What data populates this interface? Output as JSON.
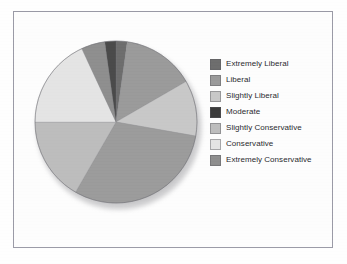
{
  "chart_data": {
    "type": "pie",
    "title": "",
    "legend_position": "right",
    "categories": [
      "Extremely Liberal",
      "Liberal",
      "Slightly Liberal",
      "Moderate",
      "Slightly Conservative",
      "Conservative",
      "Extremely Conservative"
    ],
    "values": [
      2.2,
      14.4,
      11.1,
      30.6,
      16.7,
      18.1,
      6.9
    ],
    "value_unit": "percent",
    "start_angle_deg": 0,
    "direction": "clockwise",
    "slice_angles_deg": [
      8,
      52,
      40,
      110,
      60,
      65,
      25
    ],
    "colors": [
      "#6d6d6d",
      "#9a9a9a",
      "#c8c8c8",
      "#3a3a3a",
      "#bdbdbd",
      "#e4e4e4",
      "#8e8e8e"
    ]
  },
  "legend": {
    "items": [
      {
        "label": "Extremely Liberal",
        "color": "#6d6d6d"
      },
      {
        "label": "Liberal",
        "color": "#9a9a9a"
      },
      {
        "label": "Slightly Liberal",
        "color": "#c8c8c8"
      },
      {
        "label": "Moderate",
        "color": "#3a3a3a"
      },
      {
        "label": "Slightly Conservative",
        "color": "#bdbdbd"
      },
      {
        "label": "Conservative",
        "color": "#e4e4e4"
      },
      {
        "label": "Extremely Conservative",
        "color": "#8e8e8e"
      }
    ]
  },
  "pie_render": {
    "center_x": 84,
    "center_y": 84,
    "radius": 81,
    "slices": [
      {
        "name": "Extremely Liberal",
        "start": 0,
        "end": 8,
        "fill": "#6d6d6d"
      },
      {
        "name": "Liberal",
        "start": 8,
        "end": 60,
        "fill": "#9a9a9a"
      },
      {
        "name": "Slightly Liberal",
        "start": 60,
        "end": 100,
        "fill": "#c8c8c8"
      },
      {
        "name": "Moderate",
        "start": 100,
        "end": 210,
        "fill": "#9b9b9b"
      },
      {
        "name": "Slightly Conservative",
        "start": 210,
        "end": 270,
        "fill": "#bdbdbd"
      },
      {
        "name": "Conservative",
        "start": 270,
        "end": 335,
        "fill": "#e4e4e4"
      },
      {
        "name": "Extremely Conservative",
        "start": 335,
        "end": 352,
        "fill": "#8e8e8e"
      },
      {
        "name": "Extremely Liberal Dark",
        "start": 352,
        "end": 360,
        "fill": "#4a4a4a"
      }
    ]
  }
}
